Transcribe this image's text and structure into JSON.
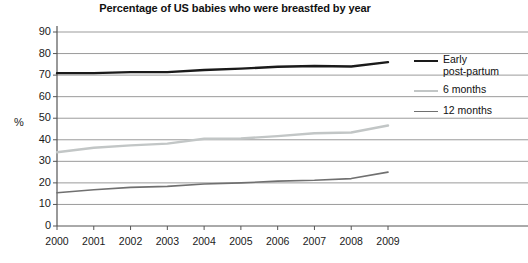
{
  "chart_data": {
    "type": "line",
    "title": "Percentage of US babies who were breastfed by year",
    "xlabel": "",
    "ylabel": "%",
    "x": [
      2000,
      2001,
      2002,
      2003,
      2004,
      2005,
      2006,
      2007,
      2008,
      2009
    ],
    "categories": [
      "2000",
      "2001",
      "2002",
      "2003",
      "2004",
      "2005",
      "2006",
      "2007",
      "2008",
      "2009"
    ],
    "ylim": [
      0,
      90
    ],
    "ytick_step": 10,
    "yticks": [
      "90",
      "80",
      "70",
      "60",
      "50",
      "40",
      "30",
      "20",
      "10",
      "0"
    ],
    "grid": true,
    "legend_position": "right",
    "series": [
      {
        "name": "Early post-partum",
        "legend_label": "Early\npost-partum",
        "color": "#1a1a1a",
        "width": 2.4,
        "values": [
          70.9,
          70.9,
          71.4,
          71.4,
          72.4,
          73.0,
          73.9,
          74.2,
          74.0,
          76.0
        ]
      },
      {
        "name": "6 months",
        "legend_label": "6 months",
        "color": "#c2c6c6",
        "width": 2.4,
        "values": [
          34.2,
          36.3,
          37.4,
          38.2,
          40.5,
          40.6,
          41.7,
          43.0,
          43.4,
          46.6
        ]
      },
      {
        "name": "12 months",
        "legend_label": "12 months",
        "color": "#707070",
        "width": 1.6,
        "values": [
          15.4,
          16.8,
          17.9,
          18.4,
          19.5,
          20.0,
          20.8,
          21.2,
          22.0,
          25.0
        ]
      }
    ]
  },
  "axis": {
    "y_label": "%",
    "x_tick_labels": [
      "2000",
      "2001",
      "2002",
      "2003",
      "2004",
      "2005",
      "2006",
      "2007",
      "2008",
      "2009"
    ],
    "y_tick_labels": [
      "90",
      "80",
      "70",
      "60",
      "50",
      "40",
      "30",
      "20",
      "10",
      "0"
    ]
  },
  "legend": {
    "items": [
      {
        "label": "Early\npost-partum"
      },
      {
        "label": "6 months"
      },
      {
        "label": "12 months"
      }
    ]
  },
  "colors": {
    "background": "#ffffff",
    "grid": "#9b9b9b",
    "axis": "#555555",
    "series_early": "#1a1a1a",
    "series_6mo": "#c2c6c6",
    "series_12mo": "#707070"
  }
}
